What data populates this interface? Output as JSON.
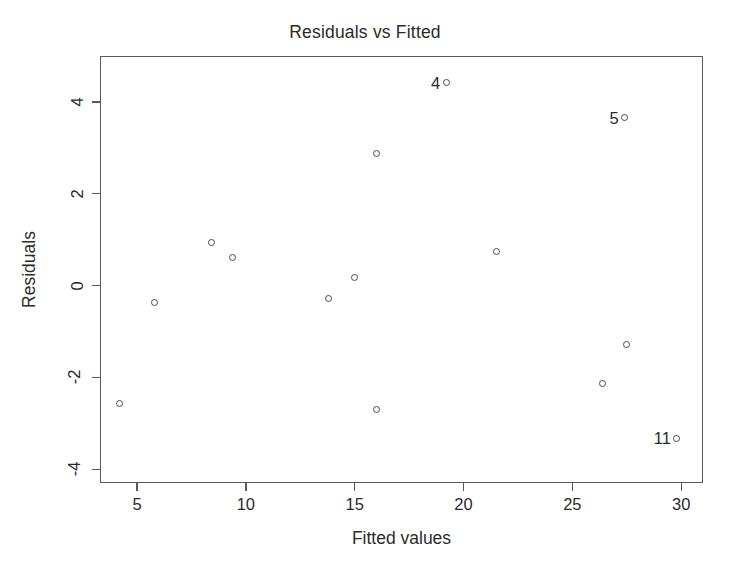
{
  "chart_data": {
    "type": "scatter",
    "title": "Residuals vs Fitted",
    "xlabel": "Fitted values",
    "ylabel": "Residuals",
    "xlim": [
      3.3,
      31.0
    ],
    "ylim": [
      -4.3,
      5.0
    ],
    "xticks": [
      5,
      10,
      15,
      20,
      25,
      30
    ],
    "yticks": [
      4,
      2,
      0,
      -2,
      -4
    ],
    "xticklabels": [
      "5",
      "10",
      "15",
      "20",
      "25",
      "30"
    ],
    "yticklabels": [
      "4",
      "2",
      "0",
      "-2",
      "-4"
    ],
    "grid": false,
    "legend": false,
    "marker": "open-circle",
    "point_color": "#4a4a4a",
    "frame_color": "#5a5a5a",
    "background": "#ffffff",
    "points": [
      {
        "x": 4.2,
        "y": -2.57,
        "label": ""
      },
      {
        "x": 5.8,
        "y": -0.37,
        "label": ""
      },
      {
        "x": 8.4,
        "y": 0.94,
        "label": ""
      },
      {
        "x": 9.4,
        "y": 0.62,
        "label": ""
      },
      {
        "x": 13.8,
        "y": -0.29,
        "label": ""
      },
      {
        "x": 15.0,
        "y": 0.17,
        "label": ""
      },
      {
        "x": 16.0,
        "y": 2.88,
        "label": ""
      },
      {
        "x": 16.0,
        "y": -2.71,
        "label": ""
      },
      {
        "x": 19.2,
        "y": 4.42,
        "label": "4"
      },
      {
        "x": 21.5,
        "y": 0.74,
        "label": ""
      },
      {
        "x": 26.4,
        "y": -2.14,
        "label": ""
      },
      {
        "x": 27.5,
        "y": -1.29,
        "label": ""
      },
      {
        "x": 27.4,
        "y": 3.66,
        "label": "5"
      },
      {
        "x": 29.8,
        "y": -3.32,
        "label": "11"
      }
    ]
  }
}
